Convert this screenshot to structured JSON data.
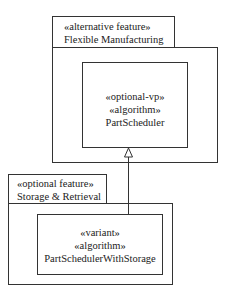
{
  "packages": [
    {
      "stereotype": "«alternative feature»",
      "name": "Flexible Manufacturing",
      "class": {
        "stereotypes": [
          "«optional-vp»",
          "«algorithm»"
        ],
        "name": "PartScheduler"
      }
    },
    {
      "stereotype": "«optional feature»",
      "name": "Storage & Retrieval",
      "class": {
        "stereotypes": [
          "«variant»",
          "«algorithm»"
        ],
        "name": "PartSchedulerWithStorage"
      }
    }
  ],
  "relationship": {
    "type": "generalization",
    "from": "PartSchedulerWithStorage",
    "to": "PartScheduler"
  }
}
